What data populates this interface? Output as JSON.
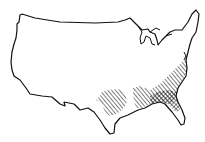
{
  "figure": {
    "type": "outline-map",
    "background_color": "#ffffff",
    "outline_color": "#111111",
    "hatch_color": "#111111",
    "regions": [
      {
        "name": "Texas-Louisiana / lower Mississippi region",
        "pattern": "diagonal-hatch"
      },
      {
        "name": "Southeast Atlantic and Gulf states (Carolinas to Alabama)",
        "pattern": "diagonal-hatch"
      },
      {
        "name": "Georgia / northern Florida / southern Alabama",
        "pattern": "cross-hatch"
      }
    ]
  }
}
